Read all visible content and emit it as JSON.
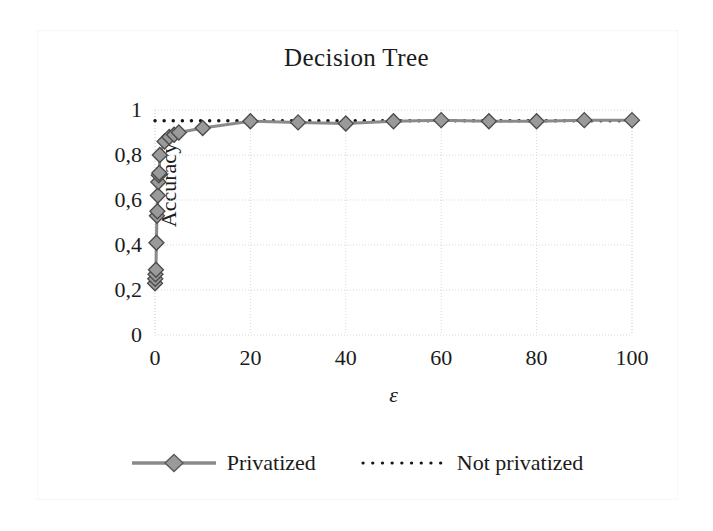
{
  "chart_data": {
    "type": "line",
    "title": "Decision Tree",
    "xlabel": "ε",
    "ylabel": "Accuracy",
    "xlim": [
      0,
      100
    ],
    "ylim": [
      0,
      1
    ],
    "grid": true,
    "legend_position": "bottom",
    "x_ticks": [
      "0",
      "20",
      "40",
      "60",
      "80",
      "100"
    ],
    "x_tick_values": [
      0,
      20,
      40,
      60,
      80,
      100
    ],
    "y_ticks": [
      "0",
      "0,2",
      "0,4",
      "0,6",
      "0,8",
      "1"
    ],
    "y_tick_values": [
      0,
      0.2,
      0.4,
      0.6,
      0.8,
      1
    ],
    "series": [
      {
        "name": "Privatized",
        "style": "solid-line-with-diamond-markers",
        "color": "#7f7f7f",
        "marker": "diamond",
        "x": [
          0.01,
          0.05,
          0.1,
          0.2,
          0.3,
          0.4,
          0.5,
          0.6,
          0.7,
          0.8,
          0.9,
          1,
          2,
          3,
          4,
          5,
          10,
          20,
          30,
          40,
          50,
          60,
          70,
          80,
          90,
          100
        ],
        "values": [
          0.23,
          0.25,
          0.27,
          0.29,
          0.41,
          0.53,
          0.55,
          0.62,
          0.68,
          0.71,
          0.72,
          0.8,
          0.86,
          0.88,
          0.89,
          0.9,
          0.92,
          0.95,
          0.945,
          0.94,
          0.95,
          0.955,
          0.95,
          0.95,
          0.955,
          0.955
        ]
      },
      {
        "name": "Not privatized",
        "style": "dotted-line",
        "color": "#000000",
        "marker": "none",
        "x": [
          0,
          100
        ],
        "values": [
          0.952,
          0.952
        ]
      }
    ],
    "legend": [
      {
        "label": "Privatized",
        "style": "solid-line-with-diamond-markers",
        "color": "#7f7f7f"
      },
      {
        "label": "Not privatized",
        "style": "dotted-line",
        "color": "#000000"
      }
    ]
  },
  "colors": {
    "privatized_line": "#8a8a8a",
    "privatized_marker_fill": "#9a9a9a",
    "privatized_marker_stroke": "#4a4a4a",
    "not_privatized_line": "#151515",
    "grid": "#d8d8d8",
    "text": "#1b1b1b",
    "background": "#ffffff"
  }
}
